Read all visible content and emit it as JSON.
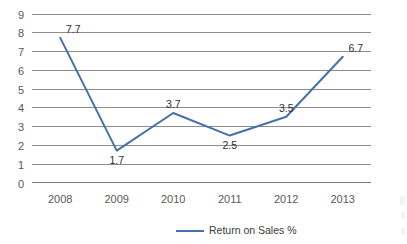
{
  "chart_data": {
    "type": "line",
    "title": "",
    "xlabel": "",
    "ylabel": "",
    "categories": [
      "2008",
      "2009",
      "2010",
      "2011",
      "2012",
      "2013"
    ],
    "series": [
      {
        "name": "Return on Sales %",
        "values": [
          7.7,
          1.7,
          3.7,
          2.5,
          3.5,
          6.7
        ],
        "color": "#4472a8"
      }
    ],
    "point_labels": [
      "7.7",
      "1.7",
      "3.7",
      "2.5",
      "3.5",
      "6.7"
    ],
    "yticks": [
      "0",
      "1",
      "2",
      "3",
      "4",
      "5",
      "6",
      "7",
      "8",
      "9"
    ],
    "ylim": [
      0,
      9
    ],
    "grid": "horizontal",
    "legend_position": "bottom",
    "legend": [
      "Return on Sales %"
    ],
    "markers": "none",
    "background_color": "#ffffff",
    "gridline_color": "#8c8c8c",
    "tick_text_color": "#585858"
  }
}
